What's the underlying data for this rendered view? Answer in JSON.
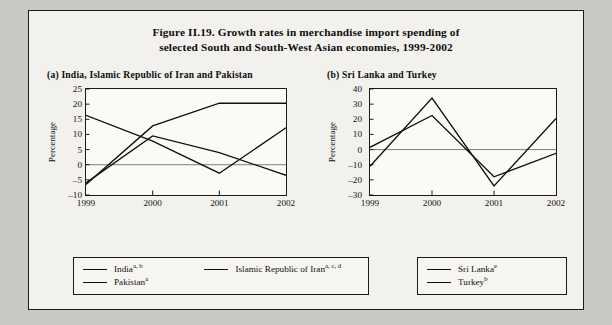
{
  "figure": {
    "title_line1": "Figure II.19.  Growth rates in merchandise import spending of",
    "title_line2": "selected South and South-West Asian economies, 1999-2002"
  },
  "panel_a": {
    "header": "(a)  India, Islamic Republic of Iran and Pakistan",
    "ylabel": "Percentage",
    "yticks": [
      "25",
      "20",
      "15",
      "10",
      "5",
      "0",
      "–5",
      "–10"
    ],
    "xticks": [
      "1999",
      "2000",
      "2001",
      "2002"
    ],
    "legend": [
      {
        "label": "India",
        "sup": "a, b"
      },
      {
        "label": "Islamic Republic of Iran",
        "sup": "a, c, d"
      },
      {
        "label": "Pakistan",
        "sup": "a"
      }
    ]
  },
  "panel_b": {
    "header": "(b)  Sri Lanka and Turkey",
    "ylabel": "Percentage",
    "yticks": [
      "40",
      "30",
      "20",
      "10",
      "0",
      "–10",
      "–20",
      "–30"
    ],
    "xticks": [
      "1999",
      "2000",
      "2001",
      "2002"
    ],
    "legend": [
      {
        "label": "Sri Lanka",
        "sup": "e"
      },
      {
        "label": "Turkey",
        "sup": "b"
      }
    ]
  },
  "chart_data": [
    {
      "type": "line",
      "panel": "(a)",
      "title": "Growth rates in merchandise import spending, India, Islamic Republic of Iran and Pakistan, 1999-2002",
      "xlabel": "",
      "ylabel": "Percentage",
      "categories": [
        "1999",
        "2000",
        "2001",
        "2002"
      ],
      "x": [
        1999,
        2000,
        2001,
        2002
      ],
      "ylim": [
        -10,
        25
      ],
      "ytick_values": [
        25,
        20,
        15,
        10,
        5,
        0,
        -5,
        -10
      ],
      "grid": false,
      "legend_position": "below",
      "series": [
        {
          "name": "India",
          "footnote": "a, b",
          "values": [
            16.3,
            7.8,
            -2.8,
            12.2
          ]
        },
        {
          "name": "Islamic Republic of Iran",
          "footnote": "a, c, d",
          "values": [
            -6.5,
            12.8,
            20.3,
            20.3
          ]
        },
        {
          "name": "Pakistan",
          "footnote": "a",
          "values": [
            -6.0,
            9.5,
            4.0,
            -3.5
          ]
        }
      ]
    },
    {
      "type": "line",
      "panel": "(b)",
      "title": "Growth rates in merchandise import spending, Sri Lanka and Turkey, 1999-2002",
      "xlabel": "",
      "ylabel": "Percentage",
      "categories": [
        "1999",
        "2000",
        "2001",
        "2002"
      ],
      "x": [
        1999,
        2000,
        2001,
        2002
      ],
      "ylim": [
        -30,
        40
      ],
      "ytick_values": [
        40,
        30,
        20,
        10,
        0,
        -10,
        -20,
        -30
      ],
      "grid": false,
      "legend_position": "below",
      "series": [
        {
          "name": "Sri Lanka",
          "footnote": "e",
          "values": [
            1.5,
            22.5,
            -18.0,
            -2.5
          ]
        },
        {
          "name": "Turkey",
          "footnote": "b",
          "values": [
            -11.0,
            34.0,
            -24.0,
            20.5
          ]
        }
      ]
    }
  ]
}
